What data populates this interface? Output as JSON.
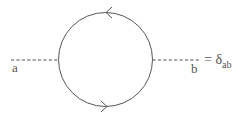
{
  "diagram": {
    "type": "feynman-diagram",
    "colors": {
      "line": "#555555",
      "background": "#ffffff"
    },
    "loop": {
      "center": [
        105.5,
        59.5
      ],
      "radius": 47,
      "arrow_top_direction": "left",
      "arrow_bottom_direction": "right"
    },
    "external_lines": {
      "left": {
        "style": "dashed",
        "from": [
          11,
          60
        ],
        "to": [
          58.5,
          60
        ]
      },
      "right": {
        "style": "dashed",
        "from": [
          152.5,
          60
        ],
        "to": [
          199,
          60
        ]
      }
    },
    "labels": {
      "left_index": "a",
      "right_index": "b"
    },
    "equation": {
      "equals": "=",
      "symbol": "δ",
      "subscript": "ab"
    }
  }
}
